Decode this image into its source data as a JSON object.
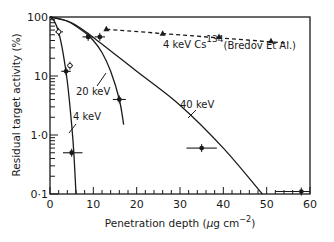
{
  "chart_data": {
    "type": "line",
    "title": "",
    "xlabel": "Penetration depth (µg cm⁻²)",
    "ylabel": "Residual target activity (%)",
    "xlim": [
      0,
      60
    ],
    "ylim": [
      0.1,
      100
    ],
    "yscale": "log",
    "x_ticks": [
      0,
      10,
      20,
      30,
      40,
      50,
      60
    ],
    "x_tick_labels": [
      "0",
      "10",
      "20",
      "30",
      "40",
      "50",
      "60"
    ],
    "y_ticks": [
      100,
      10,
      1,
      0.1
    ],
    "y_tick_labels": [
      "100",
      "10",
      "1·0",
      "0·1"
    ],
    "grid": false,
    "series": [
      {
        "name": "4 keV",
        "style": "solid",
        "curve": [
          [
            0,
            100
          ],
          [
            1,
            85
          ],
          [
            2,
            55
          ],
          [
            3,
            25
          ],
          [
            4,
            8
          ],
          [
            5,
            1.5
          ],
          [
            5.5,
            0.5
          ],
          [
            6,
            0.1
          ]
        ],
        "points": [
          {
            "x": 2.0,
            "y": 56,
            "marker": "open-circle",
            "xerr": [
              1.2,
              3.0
            ]
          },
          {
            "x": 4.6,
            "y": 15,
            "marker": "open-circle",
            "xerr": [
              4.0,
              5.3
            ]
          },
          {
            "x": 3.7,
            "y": 12,
            "marker": "filled-circle",
            "xerr": [
              2.6,
              4.8
            ]
          },
          {
            "x": 5.0,
            "y": 0.5,
            "marker": "filled-circle",
            "xerr": [
              3.0,
              7.5
            ]
          }
        ]
      },
      {
        "name": "20 keV",
        "style": "solid",
        "curve": [
          [
            0,
            100
          ],
          [
            4,
            85
          ],
          [
            8,
            55
          ],
          [
            10,
            40
          ],
          [
            12,
            25
          ],
          [
            14,
            12
          ],
          [
            16,
            4
          ],
          [
            17,
            1.5
          ]
        ],
        "points": [
          {
            "x": 8.8,
            "y": 46,
            "marker": "filled-circle",
            "xerr": [
              7.5,
              10.0
            ]
          },
          {
            "x": 11.5,
            "y": 46,
            "marker": "filled-circle",
            "xerr": [
              10.3,
              12.7
            ]
          },
          {
            "x": 16.0,
            "y": 4,
            "marker": "filled-circle",
            "xerr": [
              14.5,
              17.5
            ]
          }
        ]
      },
      {
        "name": "40 keV",
        "style": "solid",
        "curve": [
          [
            0,
            100
          ],
          [
            5,
            80
          ],
          [
            10,
            45
          ],
          [
            20,
            12
          ],
          [
            30,
            3.2
          ],
          [
            40,
            0.6
          ],
          [
            49,
            0.1
          ]
        ],
        "points": [
          {
            "x": 35.0,
            "y": 0.6,
            "marker": "filled-circle",
            "xerr": [
              31.5,
              38.5
            ]
          },
          {
            "x": 58.0,
            "y": 0.11,
            "marker": "filled-circle",
            "xerr": [
              52.0,
              60.0
            ]
          }
        ]
      },
      {
        "name": "4 keV Cs134 (Bredov Et Al.)",
        "style": "dashed",
        "curve": [
          [
            13,
            62
          ],
          [
            55,
            36
          ]
        ],
        "points": [
          {
            "x": 13.0,
            "y": 62,
            "marker": "triangle"
          },
          {
            "x": 26.0,
            "y": 52,
            "marker": "triangle"
          },
          {
            "x": 39.0,
            "y": 46,
            "marker": "triangle"
          },
          {
            "x": 51.0,
            "y": 39,
            "marker": "triangle"
          }
        ]
      }
    ],
    "annotations": [
      {
        "text": "4 keV",
        "x": 5.5,
        "y": 2.2
      },
      {
        "text": "20 keV",
        "x": 6.5,
        "y": 6.2
      },
      {
        "text": "40 keV",
        "x": 24,
        "y": 4.5
      },
      {
        "text": "4 keV Cs",
        "sup": "134",
        "suffix": "(Bredov Et Al.)",
        "x": 25,
        "y": 30
      }
    ]
  },
  "labels": {
    "xlabel_main": "Penetration depth (",
    "xlabel_mu": "µ",
    "xlabel_unit": "g cm",
    "xlabel_sup": "−2",
    "xlabel_end": ")",
    "ylabel": "Residual target activity (%)",
    "ann_4kev": "4 keV",
    "ann_20kev": "20 keV",
    "ann_40kev": "40 keV",
    "ann_cs_a": "4 keV Cs",
    "ann_cs_sup": "134",
    "ann_cs_b": "(Bredov Et Al.)"
  }
}
